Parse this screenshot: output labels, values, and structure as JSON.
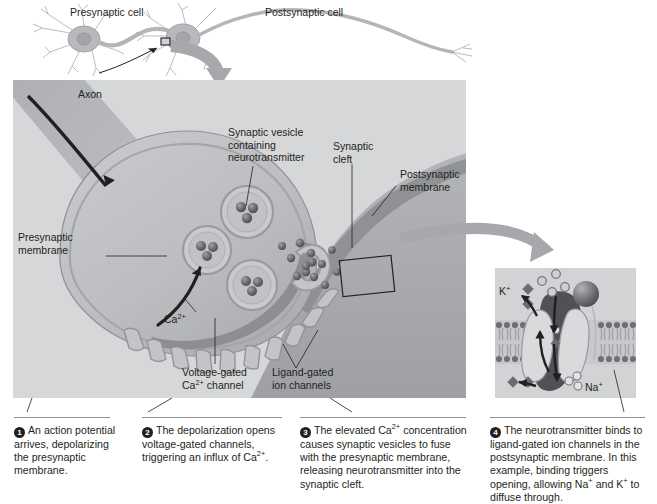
{
  "figure": {
    "top_labels": {
      "presynaptic_cell": "Presynaptic cell",
      "postsynaptic_cell": "Postsynaptic cell"
    },
    "main_panel_labels": {
      "axon": "Axon",
      "presynaptic_membrane": "Presynaptic\nmembrane",
      "synaptic_vesicle": "Synaptic vesicle\ncontaining\nneurotransmitter",
      "synaptic_cleft": "Synaptic\ncleft",
      "postsynaptic_membrane": "Postsynaptic\nmembrane",
      "calcium_ion": "Ca2+",
      "voltage_gated_channel": "Voltage-gated\nCa2+ channel",
      "ligand_gated_channels": "Ligand-gated\nion channels"
    },
    "inset_labels": {
      "potassium": "K+",
      "sodium": "Na+"
    },
    "steps": [
      {
        "number": "1",
        "text": "An action potential arrives, depolarizing the presynaptic membrane."
      },
      {
        "number": "2",
        "text": "The depolarization opens voltage-gated channels, triggering an influx of Ca2+."
      },
      {
        "number": "3",
        "text": "The elevated Ca2+ concentration causes synaptic vesicles to fuse with the presynaptic membrane, releasing neurotransmitter into the synaptic cleft."
      },
      {
        "number": "4",
        "text": "The neurotransmitter binds to ligand-gated ion channels in the postsynaptic membrane. In this example, binding triggers opening, allowing Na+ and K+ to diffuse through."
      }
    ],
    "colors": {
      "background": "#ffffff",
      "panel_fill": "#d6d7d9",
      "cell_fill": "#b9babd",
      "cell_fill_dark": "#9a9ba0",
      "membrane": "#8a8b90",
      "vesicle_core": "#5f6166",
      "text": "#231f20",
      "arrow_gray": "#a7a8ac",
      "rule": "#8f9093",
      "badge": "#231f20"
    }
  }
}
